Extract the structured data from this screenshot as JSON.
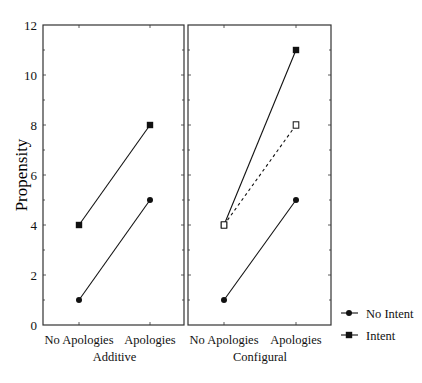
{
  "chart_data": {
    "type": "line",
    "title": "",
    "ylabel": "Propensity",
    "xlabel": "",
    "ylim": [
      0,
      12
    ],
    "yticks": [
      0,
      2,
      4,
      6,
      8,
      10,
      12
    ],
    "grid": false,
    "legend_position": "right-bottom",
    "categories": [
      "No Apologies",
      "Apologies"
    ],
    "panels": [
      {
        "name": "Additive",
        "series": [
          {
            "name": "No Intent",
            "marker": "filled-circle",
            "line": "solid",
            "values": [
              1,
              5
            ]
          },
          {
            "name": "Intent",
            "marker": "filled-square",
            "line": "solid",
            "values": [
              4,
              8
            ]
          }
        ]
      },
      {
        "name": "Configural",
        "series": [
          {
            "name": "No Intent",
            "marker": "filled-circle",
            "line": "solid",
            "values": [
              1,
              5
            ]
          },
          {
            "name": "Intent",
            "marker": "filled-square",
            "line": "solid",
            "values": [
              4,
              11
            ]
          },
          {
            "name": "Intent (additive projection)",
            "marker": "open-square",
            "line": "dashed",
            "values": [
              4,
              8
            ]
          }
        ]
      }
    ],
    "legend": [
      {
        "name": "No Intent",
        "marker": "filled-circle"
      },
      {
        "name": "Intent",
        "marker": "filled-square"
      }
    ]
  },
  "layout": {
    "panels_px": [
      {
        "x0": 43,
        "x1": 184,
        "cat_x": [
          79,
          150
        ]
      },
      {
        "x0": 188,
        "x1": 331,
        "cat_x": [
          224,
          296
        ]
      }
    ],
    "y_top_px": 25,
    "y_bottom_px": 325
  },
  "colors": {
    "ink": "#111111",
    "frame": "#333333",
    "background": "#ffffff"
  }
}
